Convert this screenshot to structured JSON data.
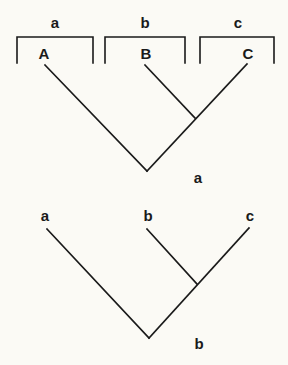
{
  "diagram": {
    "colors": {
      "background": "#fbfaf5",
      "ink": "#1a1a1a"
    },
    "tree_a": {
      "caption": "a",
      "groups": [
        {
          "label": "a",
          "taxon": "A"
        },
        {
          "label": "b",
          "taxon": "B"
        },
        {
          "label": "c",
          "taxon": "C"
        }
      ]
    },
    "tree_b": {
      "caption": "b",
      "leaves": [
        "a",
        "b",
        "c"
      ]
    }
  }
}
